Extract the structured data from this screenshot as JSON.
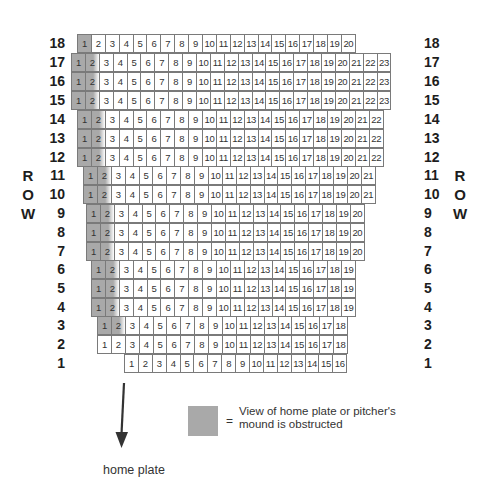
{
  "side_label": "ROW",
  "side_label_letters": [
    "R",
    "O",
    "W"
  ],
  "colors": {
    "obstructed": "#a9a9a9",
    "seat": "#ffffff",
    "border": "#7a7a7a"
  },
  "rows": [
    {
      "row": "18",
      "left": 78,
      "top": 34,
      "seats": 20,
      "obstructed": [
        1
      ]
    },
    {
      "row": "17",
      "left": 72,
      "top": 53,
      "seats": 23,
      "obstructed": [
        1,
        2
      ]
    },
    {
      "row": "16",
      "left": 72,
      "top": 72,
      "seats": 23,
      "obstructed": [
        1,
        2
      ]
    },
    {
      "row": "15",
      "left": 72,
      "top": 91,
      "seats": 23,
      "obstructed": [
        1,
        2
      ]
    },
    {
      "row": "14",
      "left": 78,
      "top": 110,
      "seats": 22,
      "obstructed": [
        1,
        2
      ]
    },
    {
      "row": "13",
      "left": 78,
      "top": 129,
      "seats": 22,
      "obstructed": [
        1,
        2
      ]
    },
    {
      "row": "12",
      "left": 78,
      "top": 148,
      "seats": 22,
      "obstructed": [
        1,
        2
      ]
    },
    {
      "row": "11",
      "left": 84,
      "top": 166,
      "seats": 21,
      "obstructed": [
        1,
        2
      ]
    },
    {
      "row": "10",
      "left": 84,
      "top": 185,
      "seats": 21,
      "obstructed": [
        1,
        2
      ]
    },
    {
      "row": "9",
      "left": 87,
      "top": 204,
      "seats": 20,
      "obstructed": [
        1,
        2
      ]
    },
    {
      "row": "8",
      "left": 87,
      "top": 223,
      "seats": 20,
      "obstructed": [
        1,
        2
      ]
    },
    {
      "row": "7",
      "left": 87,
      "top": 242,
      "seats": 20,
      "obstructed": [
        1,
        2
      ]
    },
    {
      "row": "6",
      "left": 92,
      "top": 260,
      "seats": 19,
      "obstructed": [
        1,
        2
      ]
    },
    {
      "row": "5",
      "left": 92,
      "top": 279,
      "seats": 19,
      "obstructed": [
        1,
        2
      ]
    },
    {
      "row": "4",
      "left": 92,
      "top": 298,
      "seats": 19,
      "obstructed": [
        1,
        2
      ]
    },
    {
      "row": "3",
      "left": 98,
      "top": 316,
      "seats": 18,
      "obstructed": [
        1,
        2
      ]
    },
    {
      "row": "2",
      "left": 98,
      "top": 335,
      "seats": 18,
      "obstructed": []
    },
    {
      "row": "1",
      "left": 125,
      "top": 354,
      "seats": 16,
      "obstructed": []
    }
  ],
  "legend": {
    "symbol": "=",
    "line1": "View of home plate or pitcher's",
    "line2": "mound is obstructed"
  },
  "direction": {
    "label": "home plate",
    "icon": "arrow-down-icon"
  }
}
